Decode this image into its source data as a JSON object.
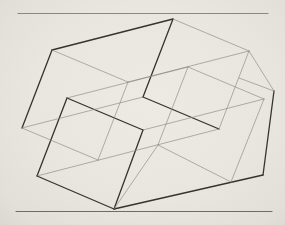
{
  "artwork": {
    "description": "geometric line drawing of two interpenetrating wireframe prisms between two horizontal rules",
    "colors": {
      "paper": "#e9e6df",
      "heavy_line": "#35332f",
      "thin_line": "#8b8881",
      "top_rule": "#8a877f",
      "bottom_rule": "#6e6b64"
    },
    "stroke_widths": {
      "heavy": 1.3,
      "thin": 0.65,
      "rule": 1.2
    },
    "frame_rules": [
      {
        "name": "top-rule",
        "x1": 18,
        "y1": 13.5,
        "x2": 268,
        "y2": 13.5,
        "color_key": "top_rule"
      },
      {
        "name": "bottom-rule",
        "x1": 16,
        "y1": 211.5,
        "x2": 272,
        "y2": 211.5,
        "color_key": "bottom_rule"
      }
    ],
    "vertices": {
      "P1": [
        173,
        19
      ],
      "P2": [
        52,
        50
      ],
      "P3": [
        22,
        128
      ],
      "P5": [
        249,
        51
      ],
      "J1": [
        143,
        97
      ],
      "Va": [
        128,
        82
      ],
      "Vc": [
        219,
        129
      ],
      "Q": [
        98,
        160
      ],
      "Vd": [
        67,
        98
      ],
      "Ve": [
        143,
        130
      ],
      "B1": [
        37,
        176
      ],
      "P4": [
        114,
        209
      ],
      "Vb": [
        188,
        67
      ],
      "R1": [
        264,
        99
      ],
      "B2": [
        158,
        145
      ],
      "R2": [
        231,
        182
      ],
      "P6": [
        274,
        91
      ],
      "Vf": [
        263,
        175
      ],
      "T1": [
        239,
        78
      ]
    },
    "edges": [
      {
        "from": "P1",
        "to": "P2",
        "weight": "heavy"
      },
      {
        "from": "P2",
        "to": "P3",
        "weight": "heavy"
      },
      {
        "from": "P1",
        "to": "J1",
        "weight": "heavy"
      },
      {
        "from": "J1",
        "to": "Vc",
        "weight": "heavy"
      },
      {
        "from": "Vd",
        "to": "Ve",
        "weight": "heavy"
      },
      {
        "from": "Vd",
        "to": "B1",
        "weight": "heavy"
      },
      {
        "from": "Ve",
        "to": "P4",
        "weight": "heavy"
      },
      {
        "from": "B1",
        "to": "P4",
        "weight": "heavy"
      },
      {
        "from": "P4",
        "to": "Vf",
        "weight": "heavy"
      },
      {
        "from": "Vf",
        "to": "P6",
        "weight": "heavy"
      },
      {
        "from": "P1",
        "to": "P5",
        "weight": "thin"
      },
      {
        "from": "P2",
        "to": "Va",
        "weight": "thin"
      },
      {
        "from": "P5",
        "to": "Va",
        "weight": "thin"
      },
      {
        "from": "Va",
        "to": "Q",
        "weight": "thin"
      },
      {
        "from": "P3",
        "to": "Q",
        "weight": "thin"
      },
      {
        "from": "B1",
        "to": "Vc",
        "weight": "thin"
      },
      {
        "from": "P5",
        "to": "Vc",
        "weight": "thin"
      },
      {
        "from": "J1",
        "to": "P3",
        "weight": "thin"
      },
      {
        "from": "Vd",
        "to": "Vb",
        "weight": "thin"
      },
      {
        "from": "Vb",
        "to": "R1",
        "weight": "thin"
      },
      {
        "from": "Vb",
        "to": "B2",
        "weight": "thin"
      },
      {
        "from": "Ve",
        "to": "R1",
        "weight": "thin"
      },
      {
        "from": "R1",
        "to": "R2",
        "weight": "thin"
      },
      {
        "from": "B2",
        "to": "R2",
        "weight": "thin"
      },
      {
        "from": "B2",
        "to": "P4",
        "weight": "thin"
      },
      {
        "from": "P5",
        "to": "P6",
        "weight": "thin"
      },
      {
        "from": "P6",
        "to": "T1",
        "weight": "thin"
      }
    ]
  }
}
